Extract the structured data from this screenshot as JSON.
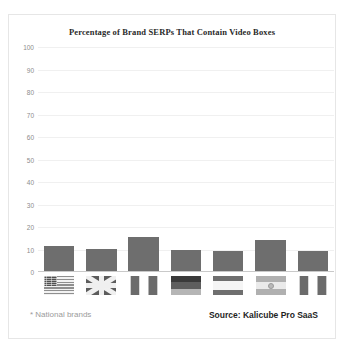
{
  "chart_data": {
    "type": "bar",
    "title": "Percentage of Brand SERPs That Contain Video Boxes",
    "xlabel": "",
    "ylabel": "",
    "ylim": [
      0,
      100
    ],
    "yticks": [
      100,
      90,
      80,
      70,
      60,
      50,
      40,
      30,
      20,
      10,
      0
    ],
    "grid": true,
    "legend": "none",
    "categories": [
      "United States",
      "United Kingdom",
      "France",
      "Germany",
      "Spain",
      "Argentina",
      "Italy"
    ],
    "category_icons": [
      "flag-usa",
      "flag-uk",
      "flag-france",
      "flag-germany",
      "flag-spain",
      "flag-argentina",
      "flag-italy"
    ],
    "values": [
      11,
      10,
      15,
      9.5,
      9,
      14,
      9
    ],
    "series": [
      {
        "name": "Percentage of Brand SERPs That Contain Video Boxes",
        "values": [
          11,
          10,
          15,
          9.5,
          9,
          14,
          9
        ]
      }
    ],
    "bar_color": "#6e6e6e",
    "gridline_color": "#f0f0f0",
    "axis_color": "#c9c9c9",
    "tick_label_color": "#8c8c8c"
  },
  "footer": {
    "footnote": "* National brands",
    "source": "Source: Kalicube Pro SaaS"
  }
}
